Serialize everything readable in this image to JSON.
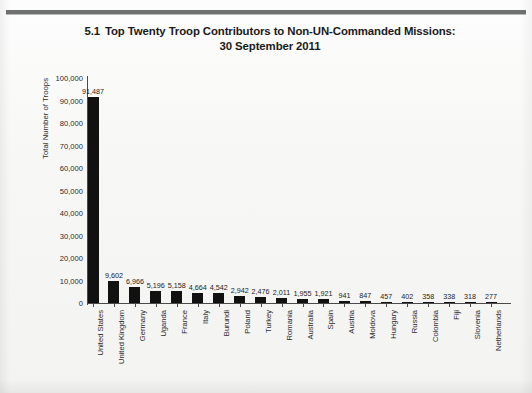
{
  "page": {
    "rule_color": "#6f7070",
    "background": "#f6f6f5"
  },
  "title": {
    "number": "5.1",
    "line1": "Top Twenty Troop Contributors to Non-UN-Commanded Missions:",
    "line2": "30 September 2011"
  },
  "chart_data": {
    "type": "bar",
    "xlabel": "",
    "ylabel": "Total Number of Troops",
    "ylim": [
      0,
      100000
    ],
    "ytick_labels": [
      "100,000",
      "90,000",
      "80,000",
      "70,000",
      "60,000",
      "50,000",
      "40,000",
      "30,000",
      "20,000",
      "10,000",
      "0"
    ],
    "ytick_values": [
      100000,
      90000,
      80000,
      70000,
      60000,
      50000,
      40000,
      30000,
      20000,
      10000,
      0
    ],
    "grid": false,
    "legend": false,
    "bar_color": "#111111",
    "categories": [
      "United States",
      "United Kingdom",
      "Germany",
      "Uganda",
      "France",
      "Italy",
      "Burundi",
      "Poland",
      "Turkey",
      "Romania",
      "Australia",
      "Spain",
      "Austria",
      "Moldova",
      "Hungary",
      "Russia",
      "Colombia",
      "Fiji",
      "Slovenia",
      "Netherlands"
    ],
    "values": [
      91487,
      9602,
      6966,
      5196,
      5158,
      4664,
      4542,
      2942,
      2476,
      2011,
      1955,
      1921,
      941,
      847,
      457,
      402,
      358,
      338,
      318,
      277
    ],
    "value_labels": [
      "91,487",
      "9,602",
      "6,966",
      "5,196",
      "5,158",
      "4,664",
      "4,542",
      "2,942",
      "2,476",
      "2,011",
      "1,955",
      "1,921",
      "941",
      "847",
      "457",
      "402",
      "358",
      "338",
      "318",
      "277"
    ]
  }
}
